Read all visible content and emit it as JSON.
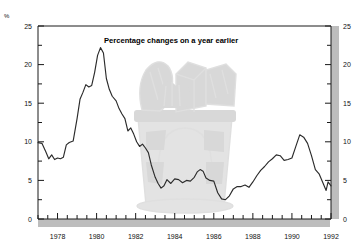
{
  "chart_data": {
    "type": "line",
    "title": "Percentage changes on a year earlier",
    "unit_label": "%",
    "xlabel": "",
    "ylabel": "",
    "ylim": [
      0,
      25
    ],
    "xlim": [
      1977.0,
      1992.0
    ],
    "grid": false,
    "legend": null,
    "y_ticks_major": [
      0,
      5,
      10,
      15,
      20,
      25
    ],
    "y_ticks_minor": [
      2.5,
      7.5,
      12.5,
      17.5,
      22.5
    ],
    "y_tick_labels_left": [
      "0",
      "5",
      "10",
      "15",
      "20",
      "25"
    ],
    "y_tick_labels_right": [
      "0",
      "5",
      "10",
      "15",
      "20",
      "25"
    ],
    "x_tick_labels": [
      "1978",
      "1980",
      "1982",
      "1984",
      "1986",
      "1988",
      "1990",
      "1992"
    ],
    "x_tick_values": [
      1978,
      1980,
      1982,
      1984,
      1986,
      1988,
      1990,
      1992
    ],
    "x_minor_tick_step": 0.5,
    "series": [
      {
        "name": "Percentage change on a year earlier",
        "color": "#2b2b2b",
        "x": [
          1977.0,
          1977.2,
          1977.4,
          1977.55,
          1977.7,
          1977.85,
          1978.0,
          1978.15,
          1978.3,
          1978.45,
          1978.6,
          1978.8,
          1979.0,
          1979.15,
          1979.3,
          1979.45,
          1979.6,
          1979.75,
          1979.9,
          1980.05,
          1980.2,
          1980.35,
          1980.5,
          1980.65,
          1980.8,
          1981.0,
          1981.15,
          1981.3,
          1981.45,
          1981.6,
          1981.75,
          1981.9,
          1982.05,
          1982.2,
          1982.35,
          1982.5,
          1982.65,
          1982.8,
          1983.0,
          1983.15,
          1983.3,
          1983.45,
          1983.6,
          1983.8,
          1984.0,
          1984.2,
          1984.4,
          1984.6,
          1984.8,
          1985.0,
          1985.15,
          1985.3,
          1985.45,
          1985.6,
          1985.8,
          1986.0,
          1986.2,
          1986.4,
          1986.6,
          1986.8,
          1987.0,
          1987.2,
          1987.4,
          1987.6,
          1987.8,
          1988.0,
          1988.2,
          1988.4,
          1988.6,
          1988.8,
          1989.0,
          1989.2,
          1989.4,
          1989.6,
          1989.8,
          1990.0,
          1990.2,
          1990.4,
          1990.6,
          1990.8,
          1991.0,
          1991.2,
          1991.4,
          1991.6,
          1991.75,
          1991.85,
          1992.0
        ],
        "y": [
          9.9,
          9.8,
          8.7,
          7.8,
          8.3,
          7.7,
          7.9,
          7.8,
          8.0,
          9.6,
          9.9,
          10.1,
          13.0,
          15.5,
          16.4,
          17.4,
          17.1,
          17.3,
          19.0,
          21.2,
          22.2,
          21.5,
          18.2,
          16.8,
          15.9,
          15.3,
          14.3,
          13.6,
          13.0,
          11.4,
          11.8,
          11.0,
          10.0,
          9.4,
          9.7,
          9.2,
          8.6,
          7.0,
          5.4,
          4.6,
          4.0,
          4.3,
          5.1,
          4.6,
          5.2,
          5.1,
          4.7,
          5.0,
          4.9,
          5.4,
          6.1,
          6.4,
          6.2,
          5.3,
          5.0,
          4.9,
          3.4,
          2.6,
          2.5,
          3.0,
          3.9,
          4.2,
          4.2,
          4.4,
          4.1,
          4.8,
          5.6,
          6.3,
          6.8,
          7.4,
          7.8,
          8.3,
          8.2,
          7.6,
          7.7,
          7.9,
          9.4,
          10.9,
          10.6,
          9.8,
          8.2,
          6.4,
          5.8,
          4.6,
          3.7,
          4.8,
          4.3
        ]
      }
    ],
    "watermark": {
      "description": "shopping-basket-with-groceries",
      "color": "#e2e2e2"
    },
    "axis_band_color": "#bdbdbd"
  }
}
